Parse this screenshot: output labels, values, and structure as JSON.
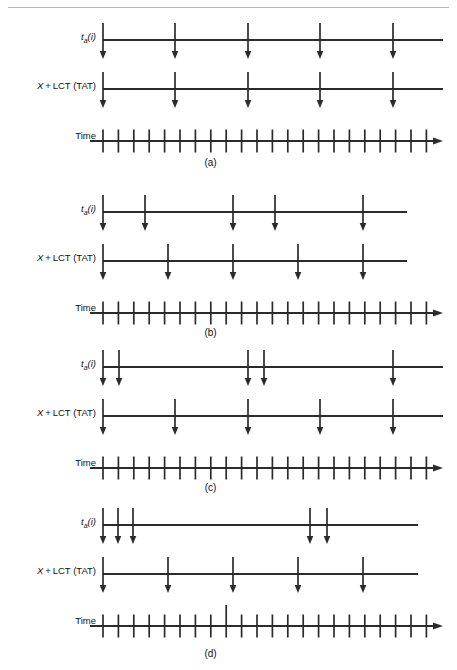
{
  "figure": {
    "header_rule_visible": true,
    "header_ghost_text": "",
    "line_color": "#2b2b2b",
    "background": "#ffffff",
    "row_labels": {
      "arrival": "ta(i)",
      "arrival_base": "t",
      "arrival_sub": "a",
      "arrival_arg": "(i)",
      "tat": "X + LCT (TAT)",
      "time": "Time"
    },
    "axis": {
      "x_start": 103,
      "x_end": 443,
      "tick_unit": 15.4
    },
    "panels": [
      {
        "id": "a",
        "caption": "(a)",
        "top": 18,
        "caption_y": 157,
        "rows": [
          {
            "name": "arrival",
            "label": "ta(i)",
            "y": 0,
            "line_x2": 443,
            "arrows": [
              103,
              175,
              248,
              320,
              393
            ]
          },
          {
            "name": "tat",
            "label": "X + LCT (TAT)",
            "y": 49,
            "line_x2": 443,
            "arrows": [
              103,
              175,
              248,
              320,
              393
            ]
          },
          {
            "name": "time",
            "label": "Time",
            "y": 99,
            "line_x2": 443,
            "ticks": 22,
            "tall_tick_index": -1
          }
        ]
      },
      {
        "id": "b",
        "caption": "(b)",
        "top": 190,
        "caption_y": 327,
        "rows": [
          {
            "name": "arrival",
            "label": "ta(i)",
            "y": 0,
            "line_x2": 407,
            "arrows": [
              103,
              145,
              233,
              275,
              363
            ]
          },
          {
            "name": "tat",
            "label": "X + LCT (TAT)",
            "y": 49,
            "line_x2": 407,
            "arrows": [
              103,
              168,
              233,
              298,
              363
            ]
          },
          {
            "name": "time",
            "label": "Time",
            "y": 99,
            "line_x2": 443,
            "ticks": 22,
            "tall_tick_index": -1
          }
        ]
      },
      {
        "id": "c",
        "caption": "(c)",
        "top": 345,
        "caption_y": 482,
        "rows": [
          {
            "name": "arrival",
            "label": "ta(i)",
            "y": 0,
            "line_x2": 443,
            "arrows": [
              103,
              119,
              248,
              264,
              393
            ]
          },
          {
            "name": "tat",
            "label": "X + LCT (TAT)",
            "y": 49,
            "line_x2": 443,
            "arrows": [
              103,
              175,
              248,
              320,
              393
            ]
          },
          {
            "name": "time",
            "label": "Time",
            "y": 99,
            "line_x2": 443,
            "ticks": 22,
            "tall_tick_index": -1
          }
        ]
      },
      {
        "id": "d",
        "caption": "(d)",
        "top": 503,
        "caption_y": 648,
        "rows": [
          {
            "name": "arrival",
            "label": "ta(i)",
            "y": 0,
            "line_x2": 418,
            "arrows": [
              103,
              118,
              133,
              310,
              327
            ]
          },
          {
            "name": "tat",
            "label": "X + LCT (TAT)",
            "y": 49,
            "line_x2": 418,
            "arrows": [
              103,
              168,
              233,
              298,
              363
            ]
          },
          {
            "name": "time",
            "label": "Time",
            "y": 99,
            "line_x2": 443,
            "ticks": 22,
            "tall_tick_index": 8
          }
        ]
      }
    ]
  }
}
